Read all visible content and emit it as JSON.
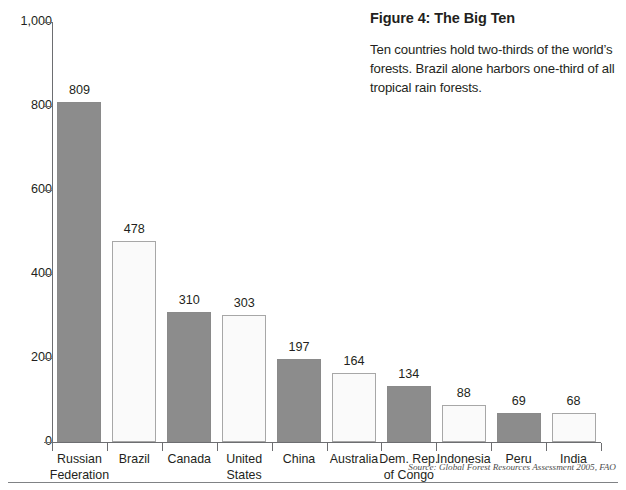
{
  "figure": {
    "title": "Figure 4: The Big Ten",
    "description": "Ten countries hold two-thirds of the world’s forests. Brazil alone harbors one-third of all tropical rain forests.",
    "source": "Source: Global Forest Resources Assessment 2005, FAO"
  },
  "chart_data": {
    "type": "bar",
    "title": "Figure 4: The Big Ten",
    "xlabel": "",
    "ylabel": "",
    "ylim": [
      0,
      1000
    ],
    "yticks": [
      0,
      200,
      400,
      600,
      800,
      1000
    ],
    "ytick_labels": [
      "0",
      "200",
      "400",
      "600",
      "800",
      "1,000"
    ],
    "grid": false,
    "legend": "none",
    "categories": [
      "Russian Federation",
      "Brazil",
      "Canada",
      "United States",
      "China",
      "Australia",
      "Dem. Rep. of Congo",
      "Indonesia",
      "Peru",
      "India"
    ],
    "category_lines": [
      [
        "Russian",
        "Federation"
      ],
      [
        "Brazil",
        ""
      ],
      [
        "Canada",
        ""
      ],
      [
        "United",
        "States"
      ],
      [
        "China",
        ""
      ],
      [
        "Australia",
        ""
      ],
      [
        "Dem. Rep.",
        "of Congo"
      ],
      [
        "Indonesia",
        ""
      ],
      [
        "Peru",
        ""
      ],
      [
        "India",
        ""
      ]
    ],
    "values": [
      809,
      478,
      310,
      303,
      197,
      164,
      134,
      88,
      69,
      68
    ],
    "value_labels": [
      "809",
      "478",
      "310",
      "303",
      "197",
      "164",
      "134",
      "88",
      "69",
      "68"
    ],
    "bar_fills": [
      "gray",
      "white",
      "gray",
      "white",
      "gray",
      "white",
      "gray",
      "white",
      "gray",
      "white"
    ],
    "colors": {
      "bar_gray": "#8c8c8c",
      "bar_white": "#fafafa",
      "bar_white_border": "#a7a7a7",
      "axis": "#6d6e71",
      "text": "#231f20",
      "source_text": "#4d4d4d",
      "background": "#ffffff"
    }
  }
}
